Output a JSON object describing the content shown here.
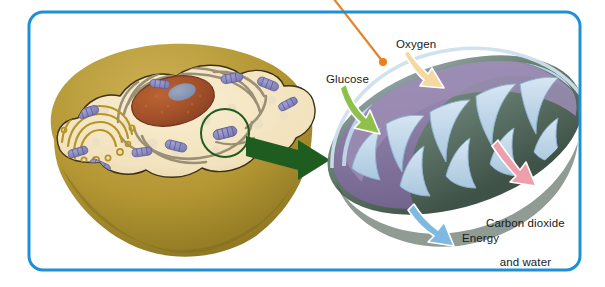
{
  "figure": {
    "kind": "cell-biology-diagram",
    "background_color": "#ffffff",
    "frame": {
      "name": "figure-border",
      "color": "#1f8fd6",
      "shape": "rounded-rectangle",
      "x": 29,
      "y": 12,
      "width": 551,
      "height": 258,
      "radius": 14,
      "stroke_width": 3
    },
    "top_cut_text": " "
  },
  "labels": {
    "oxygen": "Oxygen",
    "glucose": "Glucose",
    "carbon_dioxide_line1": "Carbon dioxide",
    "carbon_dioxide_line2": "and water",
    "energy": "Energy"
  },
  "arrows": [
    {
      "name": "oxygen-arrow",
      "label": "Oxygen",
      "color": "#f5d9a0",
      "outline": "#ffffff",
      "direction": "into-mitochondrion"
    },
    {
      "name": "glucose-arrow",
      "label": "Glucose",
      "color": "#8fc14a",
      "outline": "#ffffff",
      "direction": "into-mitochondrion"
    },
    {
      "name": "co2-arrow",
      "label": "Carbon dioxide and water",
      "color": "#eda0ac",
      "outline": "#ffffff",
      "direction": "out-of-mitochondrion"
    },
    {
      "name": "energy-arrow",
      "label": "Energy",
      "color": "#7fb8e0",
      "outline": "#ffffff",
      "direction": "out-of-mitochondrion"
    },
    {
      "name": "magnify-arrow",
      "label": "",
      "color": "#1f5c20",
      "outline": "none",
      "direction": "cell-to-mitochondrion"
    }
  ],
  "leader_line": {
    "name": "orange-leader-line",
    "color": "#e8822a",
    "dot_color": "#ef7d1a",
    "from_x": 333,
    "from_y": 0,
    "to_x": 383,
    "to_y": 62,
    "dot_radius": 4
  },
  "cell": {
    "name": "animal-cell-cutaway",
    "exterior_color": "#b79b3c",
    "exterior_shadow": "#8d7525",
    "cytoplasm_color": "#f5e6c4",
    "membrane_outline": "#3a2f14",
    "nucleus": {
      "name": "nucleus",
      "color": "#a9542a",
      "speckle_color": "#c8713c",
      "nucleolus_color": "#8795b5",
      "cx": 173,
      "cy": 101,
      "rx": 42,
      "ry": 24,
      "rotate": -13
    },
    "golgi": {
      "name": "golgi-apparatus",
      "color": "#b99a35"
    },
    "endoplasmic_reticulum": {
      "name": "rough-endoplasmic-reticulum",
      "color": "#9d9276"
    },
    "mitochondria": {
      "name": "mitochondria",
      "color": "#8f8ec4",
      "stripe_color": "#6f6eae",
      "count": 12
    },
    "vesicles": {
      "name": "vesicles",
      "color": "#e8dcc0"
    },
    "highlight_circle": {
      "name": "magnified-region-circle",
      "color": "#1f5c20",
      "cx": 225,
      "cy": 133,
      "r": 24,
      "stroke_width": 2
    }
  },
  "mitochondrion": {
    "name": "mitochondrion-cutaway",
    "outer_membrane_color": "#5f7a6a",
    "outer_membrane_dark": "#44584c",
    "matrix_color": "#7e6f94",
    "matrix_light": "#a396b8",
    "cristae_color": "#bcd4e8",
    "cristae_outline": "#8fb2cf",
    "cx": 455,
    "cy": 135,
    "rx": 130,
    "ry": 70,
    "rotate": -18,
    "cristae_count": 9
  }
}
